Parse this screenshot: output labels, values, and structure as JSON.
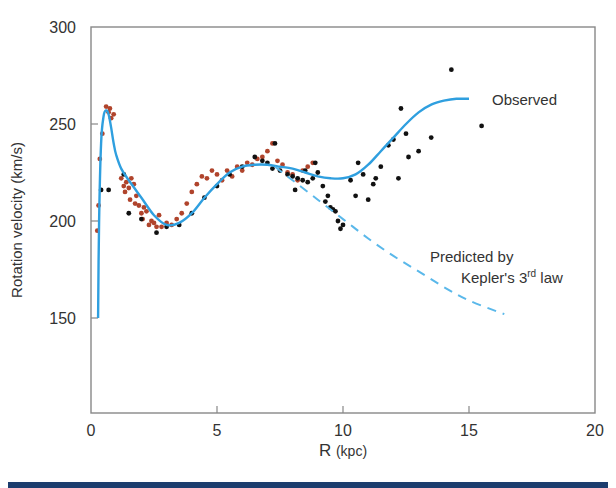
{
  "chart_data": {
    "type": "scatter",
    "title": "",
    "xlabel": "R (kpc)",
    "ylabel": "Rotation velocity (km/s)",
    "xlim": [
      0,
      20
    ],
    "ylim": [
      105,
      300
    ],
    "xticks": [
      0,
      5,
      10,
      15,
      20
    ],
    "yticks": [
      150,
      200,
      250,
      300
    ],
    "grid": false,
    "annotations": [
      {
        "text": "Observed",
        "x": 15.9,
        "y": 262
      },
      {
        "text": "Predicted by",
        "x": 13.7,
        "y": 212
      },
      {
        "text": "Kepler's 3",
        "sup": "rd",
        "suffix": " law",
        "x": 14.1,
        "y": 198
      }
    ],
    "series": [
      {
        "name": "Observed",
        "kind": "line",
        "style": "solid",
        "color": "#2f9fdf",
        "x": [
          0.28,
          0.32,
          0.4,
          0.5,
          0.6,
          0.7,
          0.8,
          0.9,
          1.0,
          1.2,
          1.5,
          2.0,
          2.5,
          3.0,
          3.5,
          4.0,
          4.5,
          5.0,
          5.5,
          6.0,
          6.5,
          7.0,
          7.5,
          8.0,
          8.5,
          9.0,
          9.5,
          10.0,
          10.5,
          11.0,
          11.5,
          12.0,
          12.5,
          13.0,
          13.5,
          14.0,
          14.5,
          15.0
        ],
        "y": [
          150,
          200,
          240,
          254,
          257,
          255,
          248,
          240,
          234,
          227,
          221,
          212,
          203,
          198,
          199,
          204,
          212,
          219,
          225,
          228,
          229,
          229,
          228,
          227,
          225,
          223,
          222,
          222,
          224,
          229,
          236,
          243,
          250,
          256,
          260,
          262,
          263,
          263
        ]
      },
      {
        "name": "Predicted by Kepler's 3rd law",
        "kind": "line",
        "style": "dashed",
        "color": "#5ab8ea",
        "x": [
          7.3,
          8.0,
          9.0,
          10.0,
          11.0,
          12.0,
          13.0,
          14.0,
          15.0,
          16.4
        ],
        "y": [
          228,
          221,
          211,
          201,
          191,
          182,
          174,
          166,
          159,
          152
        ]
      },
      {
        "name": "Data (red)",
        "kind": "points",
        "color": "#b0442c",
        "x": [
          0.25,
          0.3,
          0.35,
          0.45,
          0.6,
          0.7,
          0.75,
          0.8,
          0.9,
          1.2,
          1.3,
          1.4,
          1.5,
          1.6,
          1.7,
          1.8,
          1.9,
          2.0,
          2.1,
          2.2,
          2.4,
          2.5,
          2.6,
          2.8,
          3.0,
          3.2,
          3.4,
          3.6,
          3.8,
          4.0,
          4.2,
          4.4,
          4.6,
          4.8,
          5.0,
          5.2,
          5.4,
          5.6,
          5.8,
          6.0,
          6.2,
          6.4,
          6.6,
          6.8,
          7.0,
          7.2,
          7.4,
          7.6,
          7.8,
          8.0,
          8.2,
          8.4,
          8.6,
          8.8,
          1.35,
          1.55,
          1.75,
          2.05,
          2.3,
          2.7
        ],
        "y": [
          195,
          208,
          232,
          245,
          259,
          256,
          258,
          253,
          255,
          222,
          218,
          220,
          217,
          222,
          219,
          213,
          208,
          204,
          207,
          205,
          200,
          199,
          197,
          197,
          199,
          198,
          201,
          204,
          209,
          215,
          219,
          223,
          222,
          226,
          224,
          221,
          226,
          223,
          228,
          226,
          230,
          229,
          232,
          233,
          236,
          240,
          231,
          229,
          225,
          224,
          221,
          226,
          228,
          230,
          215,
          211,
          209,
          201,
          198,
          203
        ]
      },
      {
        "name": "Data (black)",
        "kind": "points",
        "color": "#111111",
        "x": [
          0.4,
          0.7,
          1.3,
          1.5,
          2.0,
          2.6,
          3.0,
          3.5,
          4.0,
          4.5,
          5.0,
          5.5,
          6.0,
          6.5,
          6.8,
          7.0,
          7.2,
          7.5,
          7.8,
          8.0,
          8.2,
          8.4,
          8.5,
          8.6,
          8.8,
          9.0,
          9.2,
          9.4,
          9.5,
          9.6,
          9.8,
          10.0,
          10.3,
          10.5,
          10.8,
          11.0,
          11.2,
          11.5,
          11.8,
          12.0,
          12.2,
          12.5,
          12.6,
          13.0,
          13.5,
          14.3,
          15.5,
          7.3,
          8.1,
          8.9,
          9.3,
          9.7,
          9.9,
          10.6,
          11.3,
          12.3
        ],
        "y": [
          216,
          216,
          224,
          204,
          201,
          194,
          197,
          198,
          204,
          212,
          218,
          224,
          228,
          233,
          231,
          230,
          227,
          226,
          224,
          223,
          222,
          221,
          226,
          220,
          222,
          225,
          218,
          213,
          207,
          206,
          200,
          198,
          221,
          213,
          224,
          211,
          219,
          228,
          239,
          242,
          222,
          245,
          233,
          236,
          243,
          278,
          249,
          240,
          216,
          230,
          210,
          205,
          196,
          230,
          222,
          258
        ]
      }
    ]
  },
  "footer": {
    "bar_color": "#1c3d6e"
  }
}
